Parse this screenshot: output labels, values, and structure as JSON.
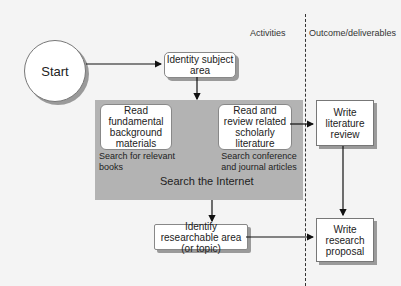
{
  "columns": {
    "activities": "Activities",
    "outcomes": "Outcome/deliverables"
  },
  "nodes": {
    "start": "Start",
    "identity_subject": "Identity subject area",
    "read_fundamental": "Read fundamental background materials",
    "search_books": "Search for relevant books",
    "read_review": "Read and review related scholarly literature",
    "search_conference": "Search conference and journal articles",
    "search_internet": "Search the Internet",
    "identify_area": "Identify researchable area (or topic)",
    "write_review": "Write literature review",
    "write_proposal": "Write research proposal"
  },
  "colors": {
    "background": "#f4f4f4",
    "search_region": "#b3b3b3",
    "shadow": "#9a9a9a",
    "line": "#111111"
  }
}
